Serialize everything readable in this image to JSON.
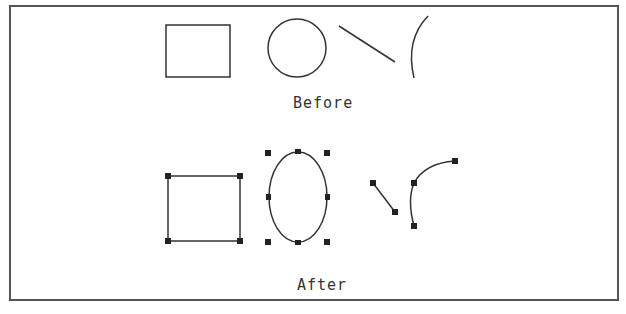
{
  "colors": {
    "stroke": "#333333",
    "frame": "#555555",
    "handle": "#222222",
    "background": "#ffffff"
  },
  "captions": {
    "before": "Before",
    "after": "After"
  },
  "before": {
    "shapes": [
      "rectangle",
      "circle",
      "line",
      "arc"
    ]
  },
  "after": {
    "shapes": [
      "rectangle-with-handles",
      "ellipse-with-handles",
      "line-with-handles",
      "arc-with-handles"
    ]
  }
}
